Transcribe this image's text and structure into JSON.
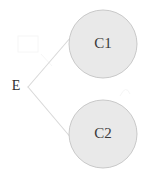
{
  "diagram": {
    "type": "node-link-graph",
    "canvas": {
      "width": 150,
      "height": 174,
      "background": "#ffffff"
    },
    "style": {
      "node_fill": "#e9e9e9",
      "node_stroke": "#c9c9c9",
      "edge_stroke": "#d9d9d9",
      "label_color": "#3a3a3a",
      "artifact_stroke": "#f6f6f6"
    },
    "nodes": [
      {
        "id": "E",
        "label": "E",
        "shape": "none",
        "x": 16,
        "y": 87
      },
      {
        "id": "C1",
        "label": "C1",
        "shape": "circle",
        "cx": 103,
        "cy": 44,
        "r": 34
      },
      {
        "id": "C2",
        "label": "C2",
        "shape": "circle",
        "cx": 103,
        "cy": 134,
        "r": 34
      }
    ],
    "branch_vertex": {
      "x": 28,
      "y": 87
    },
    "edges": [
      {
        "id": "edge-e-c1",
        "from": "E",
        "to": "C1",
        "x1": 28,
        "y1": 87,
        "x2": 71,
        "y2": 37
      },
      {
        "id": "edge-e-c2",
        "from": "E",
        "to": "C2",
        "x1": 28,
        "y1": 87,
        "x2": 72,
        "y2": 139
      }
    ],
    "artifacts": [
      {
        "id": "artifact-upper-left",
        "x": 18,
        "y": 36,
        "width": 20,
        "height": 16
      },
      {
        "id": "artifact-right-c2",
        "x": 118,
        "y": 84,
        "width": 12,
        "height": 12
      }
    ]
  }
}
